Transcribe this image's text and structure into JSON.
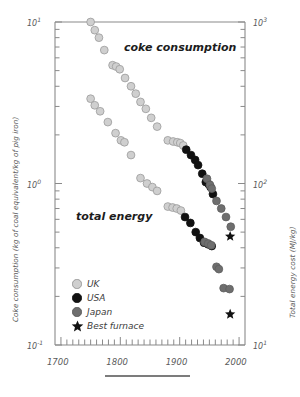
{
  "axes": {
    "left_title": "Coke consumption (kg of coal equivalent/kg of pig iron)",
    "right_title": "Total energy cost  (MJ/kg)",
    "left_ticks": [
      {
        "label": "10",
        "exp": "1",
        "value": 10
      },
      {
        "label": "10",
        "exp": "0",
        "value": 1
      },
      {
        "label": "10",
        "exp": "-1",
        "value": 0.1
      }
    ],
    "right_ticks": [
      {
        "label": "10",
        "exp": "3",
        "value": 1000
      },
      {
        "label": "10",
        "exp": "2",
        "value": 100
      },
      {
        "label": "10",
        "exp": "1",
        "value": 10
      }
    ],
    "x_ticks": [
      "1700",
      "1800",
      "1900",
      "2000"
    ]
  },
  "annotations": {
    "coke": "coke consumption",
    "total": "total energy"
  },
  "legend": [
    {
      "label": "UK",
      "marker": "circle",
      "color": "#cfcfcf",
      "edge": "#9a9a9a"
    },
    {
      "label": "USA",
      "marker": "circle",
      "color": "#111111",
      "edge": "#111111"
    },
    {
      "label": "Japan",
      "marker": "circle",
      "color": "#6e6e6e",
      "edge": "#5a5a5a"
    },
    {
      "label": "Best furnace",
      "marker": "star",
      "color": "#111111",
      "edge": "#111111"
    }
  ],
  "chart_data": {
    "type": "scatter",
    "title": "",
    "xlabel": "",
    "ylabel": "Coke consumption (kg of coal equivalent/kg of pig iron)",
    "ylabel_right": "Total energy cost  (MJ/kg)",
    "xlim": [
      1690,
      2010
    ],
    "ylim": [
      0.1,
      10
    ],
    "ylim_right": [
      10,
      1000
    ],
    "yscale": "log",
    "xscale": "linear",
    "grid": false,
    "legend_position": "lower-left",
    "xtick_minor_step": 10,
    "series": [
      {
        "name": "UK",
        "curve": "coke consumption",
        "marker": "circle",
        "color": "#cfcfcf",
        "points": [
          [
            1750,
            10.0
          ],
          [
            1757,
            8.9
          ],
          [
            1764,
            8.0
          ],
          [
            1773,
            6.7
          ],
          [
            1787,
            5.4
          ],
          [
            1793,
            5.3
          ],
          [
            1799,
            5.1
          ],
          [
            1808,
            4.5
          ],
          [
            1818,
            4.0
          ],
          [
            1826,
            3.6
          ],
          [
            1834,
            3.2
          ],
          [
            1843,
            2.9
          ],
          [
            1852,
            2.55
          ],
          [
            1862,
            2.25
          ],
          [
            1880,
            1.85
          ],
          [
            1889,
            1.82
          ],
          [
            1896,
            1.8
          ],
          [
            1901,
            1.78
          ],
          [
            1906,
            1.72
          ]
        ]
      },
      {
        "name": "USA",
        "curve": "coke consumption",
        "marker": "circle",
        "color": "#111111",
        "points": [
          [
            1911,
            1.62
          ],
          [
            1919,
            1.5
          ],
          [
            1926,
            1.4
          ],
          [
            1931,
            1.3
          ],
          [
            1938,
            1.15
          ],
          [
            1944,
            1.02
          ],
          [
            1949,
            0.99
          ],
          [
            1952,
            0.95
          ],
          [
            1956,
            0.86
          ]
        ]
      },
      {
        "name": "Japan",
        "curve": "coke consumption",
        "marker": "circle",
        "color": "#6e6e6e",
        "points": [
          [
            1946,
            1.07
          ],
          [
            1951,
            0.98
          ],
          [
            1954,
            0.93
          ],
          [
            1962,
            0.78
          ],
          [
            1970,
            0.7
          ],
          [
            1978,
            0.62
          ],
          [
            1986,
            0.54
          ]
        ]
      },
      {
        "name": "UK",
        "curve": "total energy",
        "marker": "circle",
        "color": "#cfcfcf",
        "points": [
          [
            1750,
            3.35
          ],
          [
            1757,
            3.05
          ],
          [
            1766,
            2.8
          ],
          [
            1779,
            2.4
          ],
          [
            1792,
            2.05
          ],
          [
            1801,
            1.85
          ],
          [
            1807,
            1.8
          ],
          [
            1818,
            1.5
          ],
          [
            1834,
            1.08
          ],
          [
            1845,
            1.0
          ],
          [
            1854,
            0.95
          ],
          [
            1862,
            0.9
          ],
          [
            1880,
            0.72
          ],
          [
            1888,
            0.71
          ],
          [
            1895,
            0.7
          ],
          [
            1902,
            0.68
          ]
        ]
      },
      {
        "name": "USA",
        "curve": "total energy",
        "marker": "circle",
        "color": "#111111",
        "points": [
          [
            1909,
            0.62
          ],
          [
            1918,
            0.57
          ],
          [
            1927,
            0.5
          ],
          [
            1934,
            0.46
          ],
          [
            1941,
            0.43
          ],
          [
            1948,
            0.42
          ],
          [
            1954,
            0.41
          ]
        ]
      },
      {
        "name": "Japan",
        "curve": "total energy",
        "marker": "circle",
        "color": "#6e6e6e",
        "points": [
          [
            1942,
            0.435
          ],
          [
            1948,
            0.425
          ],
          [
            1953,
            0.415
          ],
          [
            1962,
            0.305
          ],
          [
            1966,
            0.295
          ],
          [
            1974,
            0.225
          ],
          [
            1984,
            0.222
          ]
        ]
      },
      {
        "name": "Best furnace",
        "curve": "coke consumption",
        "marker": "star",
        "color": "#111111",
        "points": [
          [
            1985,
            0.47
          ]
        ]
      },
      {
        "name": "Best furnace",
        "curve": "total energy",
        "marker": "star",
        "color": "#111111",
        "points": [
          [
            1985,
            0.155
          ]
        ]
      }
    ]
  }
}
